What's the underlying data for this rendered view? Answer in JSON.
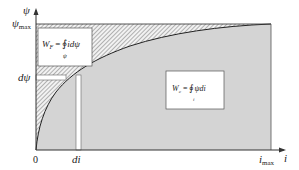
{
  "diagram": {
    "type": "magnetization-energy-coenergy",
    "colors": {
      "background": "#ffffff",
      "coenergy_fill": "#d4d4d4",
      "hatch_line": "#7a7a7a",
      "hatch_bg": "#f2f2f2",
      "axis": "#333333",
      "curve": "#222222",
      "box_fill": "#ffffff",
      "box_border": "#555555"
    },
    "axes": {
      "y_label": "ψ",
      "y_max_label": "ψ",
      "y_max_sub": "max",
      "x_label": "i",
      "x_max_label": "i",
      "x_max_sub": "max",
      "origin_label": "0",
      "dpsi_label": "dψ",
      "di_label": "di"
    },
    "boxes": {
      "field_energy": {
        "lhs": "W",
        "lhs_sub": "F",
        "eq": "=",
        "integral": "∮",
        "integrand": "idψ",
        "lower_limit": "ψ"
      },
      "coenergy": {
        "lhs": "W",
        "lhs_sub": "c",
        "eq": "=",
        "integral": "∮",
        "integrand": "ψdi",
        "lower_limit": "i"
      }
    }
  }
}
